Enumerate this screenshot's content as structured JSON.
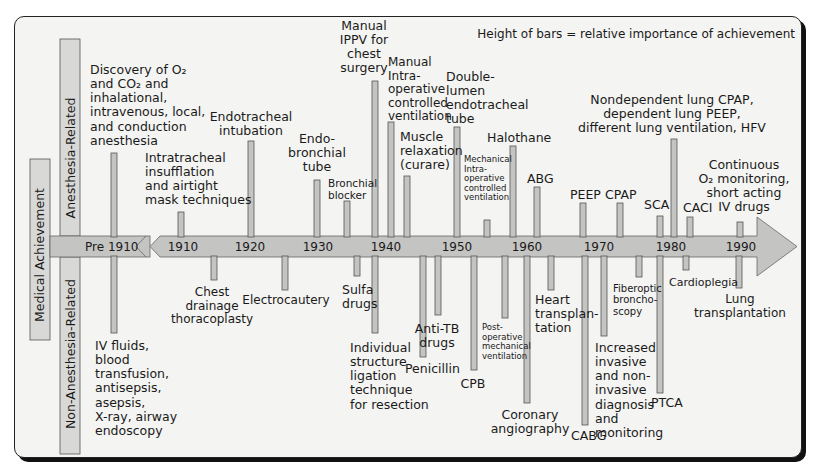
{
  "legend_note": "Height of bars = relative importance of achievement",
  "side_labels": {
    "main": "Medical Achievement",
    "top": "Anesthesia-Related",
    "bottom": "Non-Anesthesia-Related"
  },
  "axis": {
    "pre_label": "Pre 1910",
    "ticks": [
      {
        "label": "1910",
        "x": 183
      },
      {
        "label": "1920",
        "x": 250
      },
      {
        "label": "1930",
        "x": 318
      },
      {
        "label": "1940",
        "x": 386
      },
      {
        "label": "1950",
        "x": 457
      },
      {
        "label": "1960",
        "x": 527
      },
      {
        "label": "1970",
        "x": 599
      },
      {
        "label": "1980",
        "x": 671
      },
      {
        "label": "1990",
        "x": 741
      }
    ]
  },
  "chart_data": {
    "type": "bar",
    "note": "Height of bars = relative importance of achievement",
    "xlabel": "Year",
    "categories": [
      "Pre 1910",
      "1910",
      "1920",
      "1930",
      "1940",
      "1950",
      "1960",
      "1970",
      "1980",
      "1990"
    ],
    "anesthesia_related": [
      {
        "label": "Discovery of O2 and CO2 and inhalational, intravenous, local, and conduction anesthesia",
        "x": 114,
        "top": 153,
        "lines": [
          "Discovery of O₂",
          "and CO₂ and",
          "inhalational,",
          "intravenous, local,",
          "and conduction",
          "anesthesia"
        ],
        "tx": 90,
        "ty": 74,
        "anchor": "start",
        "fs": 12.5
      },
      {
        "label": "Intratracheal insufflation and airtight mask techniques",
        "x": 181,
        "top": 212,
        "lines": [
          "Intratracheal",
          "insufflation",
          "and airtight",
          "mask techniques"
        ],
        "tx": 145,
        "ty": 162,
        "anchor": "start",
        "fs": 12.5
      },
      {
        "label": "Endotracheal intubation",
        "x": 251,
        "top": 141,
        "lines": [
          "Endotracheal",
          "intubation"
        ],
        "tx": 251,
        "ty": 121,
        "anchor": "middle",
        "fs": 12.5
      },
      {
        "label": "Endo-bronchial tube",
        "x": 317,
        "top": 180,
        "lines": [
          "Endo-",
          "bronchial",
          "tube"
        ],
        "tx": 317,
        "ty": 143,
        "anchor": "middle",
        "fs": 12.5
      },
      {
        "label": "Bronchial blocker",
        "x": 347,
        "top": 201,
        "lines": [
          "Bronchial",
          "blocker"
        ],
        "tx": 328,
        "ty": 187,
        "anchor": "start",
        "fs": 10.5
      },
      {
        "label": "Manual IPPV for chest surgery",
        "x": 375,
        "top": 81,
        "lines": [
          "Manual",
          "IPPV for",
          "chest",
          "surgery"
        ],
        "tx": 364,
        "ty": 30,
        "anchor": "middle",
        "fs": 12.5
      },
      {
        "label": "Manual intra-operative controlled ventilation",
        "x": 391,
        "top": 122,
        "lines": [
          "Manual",
          "Intra-",
          "operative",
          "controlled",
          "ventilation"
        ],
        "tx": 388,
        "ty": 66,
        "anchor": "start",
        "fs": 12
      },
      {
        "label": "Muscle relaxation (curare)",
        "x": 407,
        "top": 176,
        "lines": [
          "Muscle",
          "relaxation",
          "(curare)"
        ],
        "tx": 400,
        "ty": 141,
        "anchor": "start",
        "fs": 12.5
      },
      {
        "label": "Double-lumen endotracheal tube",
        "x": 457,
        "top": 127,
        "lines": [
          "Double-",
          "lumen",
          "endotracheal",
          "tube"
        ],
        "tx": 446,
        "ty": 81,
        "anchor": "start",
        "fs": 12.5
      },
      {
        "label": "Mechanical intra-operative controlled ventilation",
        "x": 487,
        "top": 220,
        "lines": [
          "Mechanical",
          "Intra-",
          "operative",
          "controlled",
          "ventilation"
        ],
        "tx": 464,
        "ty": 162,
        "anchor": "start",
        "fs": 8.5
      },
      {
        "label": "Halothane",
        "x": 513,
        "top": 146,
        "lines": [
          "Halothane"
        ],
        "tx": 487,
        "ty": 142,
        "anchor": "start",
        "fs": 12.5
      },
      {
        "label": "ABG",
        "x": 537,
        "top": 187,
        "lines": [
          "ABG"
        ],
        "tx": 527,
        "ty": 183,
        "anchor": "start",
        "fs": 12.5
      },
      {
        "label": "PEEP",
        "x": 583,
        "top": 203,
        "lines": [
          "PEEP"
        ],
        "tx": 570,
        "ty": 199,
        "anchor": "start",
        "fs": 12.5
      },
      {
        "label": "CPAP",
        "x": 620,
        "top": 203,
        "lines": [
          "CPAP"
        ],
        "tx": 605,
        "ty": 199,
        "anchor": "start",
        "fs": 12.5
      },
      {
        "label": "SCA",
        "x": 660,
        "top": 216,
        "lines": [
          "SCA"
        ],
        "tx": 644,
        "ty": 209,
        "anchor": "start",
        "fs": 12.5
      },
      {
        "label": "Nondependent lung CPAP, dependent lung PEEP, different lung ventilation, HFV",
        "x": 674,
        "top": 139,
        "lines": [
          "Nondependent lung CPAP,",
          "dependent lung PEEP,",
          "different lung ventilation, HFV"
        ],
        "tx": 672,
        "ty": 104,
        "anchor": "middle",
        "fs": 12.5
      },
      {
        "label": "CACI",
        "x": 690,
        "top": 217,
        "lines": [
          "CACI"
        ],
        "tx": 683,
        "ty": 212,
        "anchor": "start",
        "fs": 12.5
      },
      {
        "label": "Continuous O2 monitoring, short acting IV drugs",
        "x": 740,
        "top": 222,
        "lines": [
          "Continuous",
          "O₂ monitoring,",
          "short acting",
          "IV drugs"
        ],
        "tx": 744,
        "ty": 169,
        "anchor": "middle",
        "fs": 12.5
      }
    ],
    "non_anesthesia_related": [
      {
        "label": "IV fluids, blood transfusion, antisepsis, asepsis, X-ray, airway endoscopy",
        "x": 114,
        "bottom": 333,
        "lines": [
          "IV fluids,",
          "blood",
          "transfusion,",
          "antisepsis,",
          "asepsis,",
          "X-ray, airway",
          "endoscopy"
        ],
        "tx": 95,
        "ty": 350,
        "anchor": "start",
        "fs": 12.5
      },
      {
        "label": "Chest drainage thoracoplasty",
        "x": 214,
        "bottom": 280,
        "lines": [
          "Chest",
          "drainage",
          "thoracoplasty"
        ],
        "tx": 212,
        "ty": 296,
        "anchor": "middle",
        "fs": 12
      },
      {
        "label": "Electrocautery",
        "x": 285,
        "bottom": 290,
        "lines": [
          "Electrocautery"
        ],
        "tx": 286,
        "ty": 304,
        "anchor": "middle",
        "fs": 12
      },
      {
        "label": "Sulfa drugs",
        "x": 357,
        "bottom": 276,
        "lines": [
          "Sulfa",
          "drugs"
        ],
        "tx": 342,
        "ty": 294,
        "anchor": "start",
        "fs": 12.5
      },
      {
        "label": "Individual structure ligation technique for resection",
        "x": 375,
        "bottom": 333,
        "lines": [
          "Individual",
          "structure",
          "ligation",
          "technique",
          "for resection"
        ],
        "tx": 350,
        "ty": 352,
        "anchor": "start",
        "fs": 12.5
      },
      {
        "label": "Penicillin",
        "x": 423,
        "bottom": 357,
        "lines": [
          "Penicillin"
        ],
        "tx": 405,
        "ty": 373,
        "anchor": "start",
        "fs": 12.5
      },
      {
        "label": "Anti-TB drugs",
        "x": 438,
        "bottom": 315,
        "lines": [
          "Anti-TB",
          "drugs"
        ],
        "tx": 437,
        "ty": 333,
        "anchor": "middle",
        "fs": 12.5
      },
      {
        "label": "CPB",
        "x": 474,
        "bottom": 370,
        "lines": [
          "CPB"
        ],
        "tx": 473,
        "ty": 388,
        "anchor": "middle",
        "fs": 12.5
      },
      {
        "label": "Post-operative mechanical ventilation",
        "x": 505,
        "bottom": 318,
        "lines": [
          "Post-",
          "operative",
          "mechanical",
          "ventilation"
        ],
        "tx": 482,
        "ty": 330,
        "anchor": "start",
        "fs": 8.5
      },
      {
        "label": "Coronary angiography",
        "x": 527,
        "bottom": 403,
        "lines": [
          "Coronary",
          "angiography"
        ],
        "tx": 530,
        "ty": 419,
        "anchor": "middle",
        "fs": 12.5
      },
      {
        "label": "Heart transplantation",
        "x": 551,
        "bottom": 290,
        "lines": [
          "Heart",
          "transplan-",
          "tation"
        ],
        "tx": 535,
        "ty": 304,
        "anchor": "start",
        "fs": 12.5
      },
      {
        "label": "CABG",
        "x": 585,
        "bottom": 425,
        "lines": [
          "CABG"
        ],
        "tx": 571,
        "ty": 440,
        "anchor": "start",
        "fs": 12.5
      },
      {
        "label": "Increased invasive and non-invasive diagnosis and monitoring",
        "x": 604,
        "bottom": 336,
        "lines": [
          "Increased",
          "invasive",
          "and non-",
          "invasive",
          "diagnosis",
          "and",
          "monitoring"
        ],
        "tx": 595,
        "ty": 352,
        "anchor": "start",
        "fs": 12.5
      },
      {
        "label": "Fiberoptic bronchoscopy",
        "x": 639,
        "bottom": 277,
        "lines": [
          "Fiberoptic",
          "broncho-",
          "scopy"
        ],
        "tx": 613,
        "ty": 292,
        "anchor": "start",
        "fs": 10
      },
      {
        "label": "PTCA",
        "x": 660,
        "bottom": 393,
        "lines": [
          "PTCA"
        ],
        "tx": 651,
        "ty": 407,
        "anchor": "start",
        "fs": 12.5
      },
      {
        "label": "Cardioplegia",
        "x": 686,
        "bottom": 270,
        "lines": [
          "Cardioplegia"
        ],
        "tx": 669,
        "ty": 286,
        "anchor": "start",
        "fs": 11
      },
      {
        "label": "Lung transplantation",
        "x": 739,
        "bottom": 288,
        "lines": [
          "Lung",
          "transplantation"
        ],
        "tx": 740,
        "ty": 303,
        "anchor": "middle",
        "fs": 12
      }
    ]
  }
}
